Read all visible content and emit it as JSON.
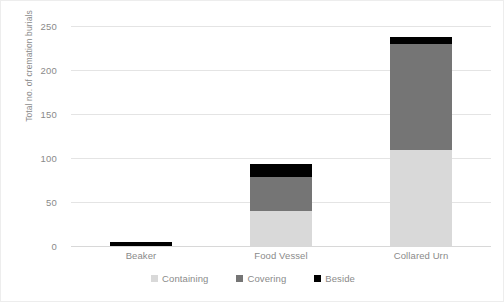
{
  "chart_data": {
    "type": "bar",
    "subtype": "stacked-bar",
    "title": "",
    "xlabel": "",
    "ylabel": "Total no. of cremation burials",
    "categories": [
      "Beaker",
      "Food Vessel",
      "Collared Urn"
    ],
    "series": [
      {
        "name": "Containing",
        "color": "#d9d9d9",
        "values": [
          0,
          40,
          109
        ]
      },
      {
        "name": "Covering",
        "color": "#757575",
        "values": [
          0,
          38,
          121
        ]
      },
      {
        "name": "Beside",
        "color": "#000000",
        "values": [
          5,
          15,
          7
        ]
      }
    ],
    "totals": [
      5,
      93,
      237
    ],
    "ylim": [
      0,
      250
    ],
    "ytick_labels": [
      "0",
      "50",
      "100",
      "150",
      "200",
      "250"
    ],
    "ytick_values": [
      0,
      50,
      100,
      150,
      200,
      250
    ],
    "grid": true,
    "grid_axis": "y",
    "legend_position": "bottom",
    "legend_entries": [
      "Containing",
      "Covering",
      "Beside"
    ]
  },
  "axes": {
    "y_title": "Total no. of cremation burials"
  }
}
